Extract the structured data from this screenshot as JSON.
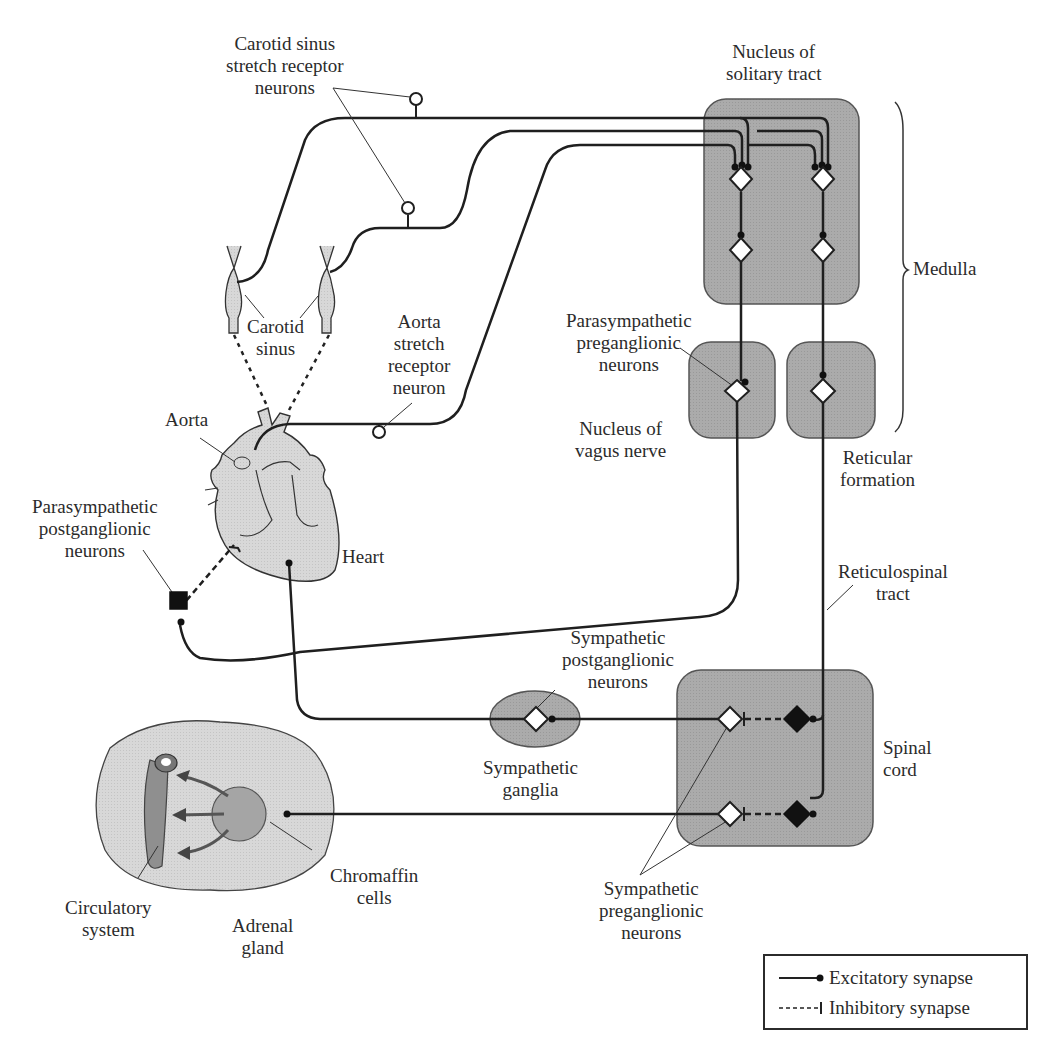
{
  "figure": {
    "type": "neural-pathway-diagram"
  },
  "labels": {
    "carotid_sinus_receptors": "Carotid sinus\nstretch receptor\nneurons",
    "nucleus_solitary_tract": "Nucleus of\nsolitary tract",
    "medulla": "Medulla",
    "carotid_sinus": "Carotid\nsinus",
    "aorta_receptor": "Aorta\nstretch\nreceptor\nneuron",
    "parasympathetic_preganglionic": "Parasympathetic\npreganglionic\nneurons",
    "nucleus_vagus": "Nucleus of\nvagus nerve",
    "aorta": "Aorta",
    "reticular_formation": "Reticular\nformation",
    "parasympathetic_postganglionic": "Parasympathetic\npostganglionic\nneurons",
    "heart": "Heart",
    "reticulospinal_tract": "Reticulospinal\ntract",
    "sympathetic_postganglionic": "Sympathetic\npostganglionic\nneurons",
    "sympathetic_ganglia": "Sympathetic\nganglia",
    "spinal_cord": "Spinal\ncord",
    "chromaffin_cells": "Chromaffin\ncells",
    "circulatory_system": "Circulatory\nsystem",
    "adrenal_gland": "Adrenal\ngland",
    "sympathetic_preganglionic": "Sympathetic\npreganglionic\nneurons"
  },
  "legend": {
    "items": [
      {
        "label": "Excitatory synapse",
        "line": "solid",
        "terminal": "dot"
      },
      {
        "label": "Inhibitory synapse",
        "line": "dashed",
        "terminal": "bar"
      }
    ]
  },
  "colors": {
    "region_fill": "#a9a9a9",
    "organ_fill": "#d6d6d6",
    "line": "#1f1f1f",
    "neuron_fill": "#ffffff",
    "inhibitory_neuron_fill": "#111111"
  }
}
